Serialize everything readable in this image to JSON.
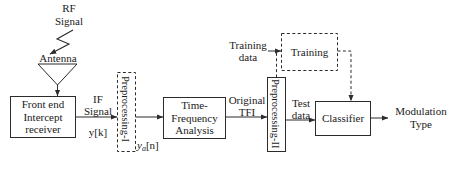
{
  "figure": {
    "type": "block-diagram"
  },
  "nodes": {
    "rf_signal": {
      "label": "RF\nSignal"
    },
    "antenna": {
      "label": "Antenna"
    },
    "front_end": {
      "label": "Front end\nIntercept\nreceiver"
    },
    "preprocessing_1": {
      "label": "Preprocessing-I",
      "style": "dashed"
    },
    "time_frequency": {
      "label": "Time-\nFrequency\nAnalysis"
    },
    "preprocessing_2": {
      "label": "Preprocessing-II",
      "style": "solid"
    },
    "training": {
      "label": "Training",
      "style": "dashed"
    },
    "classifier": {
      "label": "Classifier"
    },
    "modulation_type": {
      "label": "Modulation\nType"
    }
  },
  "edge_labels": {
    "if_signal": {
      "line1": "IF",
      "line2": "Signal"
    },
    "y_k": {
      "base": "y[k]"
    },
    "y_a_n": {
      "base": "y",
      "subscript": "a",
      "tail": "[n]"
    },
    "original_tfi": {
      "line1": "Original",
      "line2": "TFI"
    },
    "test_data": {
      "line1": "Test",
      "line2": "data"
    },
    "training_data": {
      "line1": "Training",
      "line2": "data"
    }
  },
  "colors": {
    "stroke": "#2b2b2b",
    "text": "#1a1a1a",
    "background": "#ffffff"
  }
}
